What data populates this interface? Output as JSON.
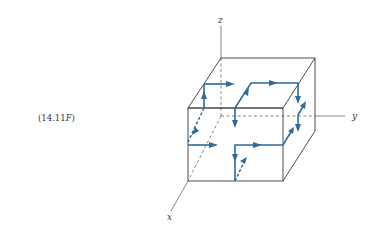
{
  "equation_label": {
    "number": "(14.11",
    "suffix": "F",
    "close": ")"
  },
  "axes": {
    "x": "x",
    "y": "y",
    "z": "z"
  },
  "colors": {
    "path": "#2f6a9a",
    "edges": "#3a3a3a"
  }
}
